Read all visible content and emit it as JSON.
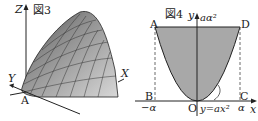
{
  "figure3": {
    "title": "図3",
    "axes": {
      "z": "Z",
      "y": "Y",
      "x": "X"
    },
    "point": "A",
    "surface_color": "#9a9a9a"
  },
  "figure4": {
    "title": "図4",
    "axes": {
      "y": "y",
      "x": "x"
    },
    "points": {
      "A": "A",
      "B": "B",
      "C": "C",
      "D": "D",
      "O": "O"
    },
    "top_label": "aα²",
    "neg_alpha": "−α",
    "alpha": "α",
    "curve_label": "y=ax²",
    "fill_color": "#a8a8a8"
  }
}
